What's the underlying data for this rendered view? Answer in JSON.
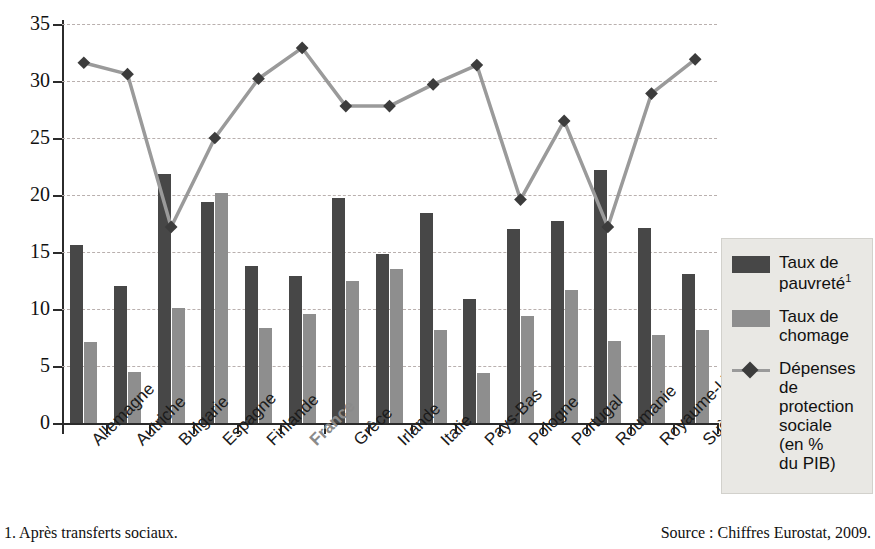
{
  "chart_data": {
    "type": "bar",
    "title": "",
    "subtitle": "",
    "xlabel": "",
    "ylabel": "",
    "ylim": [
      0,
      35
    ],
    "yticks": [
      0,
      5,
      10,
      15,
      20,
      25,
      30,
      35
    ],
    "grid": true,
    "legend_position": "right",
    "categories": [
      "Allemagne",
      "Autriche",
      "Bulgarie",
      "Espagne",
      "Finlande",
      "France",
      "Grèce",
      "Irlande",
      "Italie",
      "Pays-Bas",
      "Pologne",
      "Portugal",
      "Roumanie",
      "Royaume-Uni",
      "Suède"
    ],
    "highlight_category": "France",
    "series": [
      {
        "name": "Taux de pauvreté1",
        "type": "bar",
        "color": "#474747",
        "values": [
          15.6,
          12.0,
          21.8,
          19.4,
          13.8,
          12.9,
          19.7,
          14.8,
          18.4,
          10.9,
          17.0,
          17.7,
          22.2,
          17.1,
          13.1
        ]
      },
      {
        "name": "Taux de chomage",
        "type": "bar",
        "color": "#8e8e8e",
        "values": [
          7.1,
          4.5,
          10.1,
          20.2,
          8.3,
          9.6,
          12.5,
          13.5,
          8.2,
          4.4,
          9.4,
          11.7,
          7.2,
          7.7,
          8.2
        ]
      },
      {
        "name": "Dépenses de protection sociale (en % du PIB)",
        "type": "line",
        "color": "#9a9a9a",
        "marker_color": "#3c3c3c",
        "values": [
          31.6,
          30.6,
          17.2,
          25.0,
          30.2,
          32.9,
          27.8,
          27.8,
          29.7,
          31.4,
          19.6,
          26.5,
          17.2,
          28.9,
          31.9
        ]
      }
    ]
  },
  "legend": {
    "items": [
      {
        "marker": "square-dark",
        "line1": "Taux de",
        "line2": "pauvreté",
        "sup": "1"
      },
      {
        "marker": "square-light",
        "line1": "Taux de",
        "line2": "chomage",
        "sup": ""
      },
      {
        "marker": "diamond-line",
        "line1": "Dépenses",
        "line2": "de",
        "line3": "protection",
        "line4": "sociale",
        "line5": "(en %",
        "line6": "du PIB)",
        "sup": ""
      }
    ]
  },
  "footnote": "1. Après transferts sociaux.",
  "source": "Source : Chiffres Eurostat, 2009.",
  "colors": {
    "bar_dark": "#474747",
    "bar_light": "#8e8e8e",
    "line": "#9a9a9a",
    "marker": "#3c3c3c",
    "legend_bg": "#e9e8e4",
    "axis": "#2b2b2b",
    "grid": "#b9b0ae",
    "highlight_label": "#8a8a8a"
  }
}
